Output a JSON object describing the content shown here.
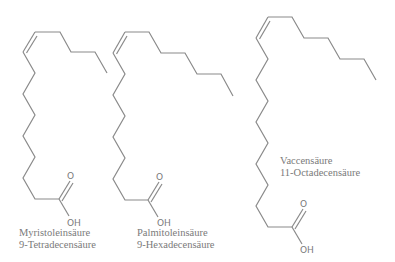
{
  "molecules": [
    {
      "id": "myristoleic",
      "name": "Myristoleinsäure",
      "systematic_name": "9-Tetradecensäure",
      "atoms": {
        "carbonyl_o": "O",
        "hydroxyl": "OH"
      }
    },
    {
      "id": "palmitoleic",
      "name": "Palmitoleinsäure",
      "systematic_name": "9-Hexadecensäure",
      "atoms": {
        "carbonyl_o": "O",
        "hydroxyl": "OH"
      }
    },
    {
      "id": "vaccenic",
      "name": "Vaccensäure",
      "systematic_name": "11-Octadecensäure",
      "atoms": {
        "carbonyl_o": "O",
        "hydroxyl": "OH"
      }
    }
  ],
  "colors": {
    "bond": "#8a8a8a",
    "text": "#7a7a7a",
    "background": "#ffffff"
  }
}
